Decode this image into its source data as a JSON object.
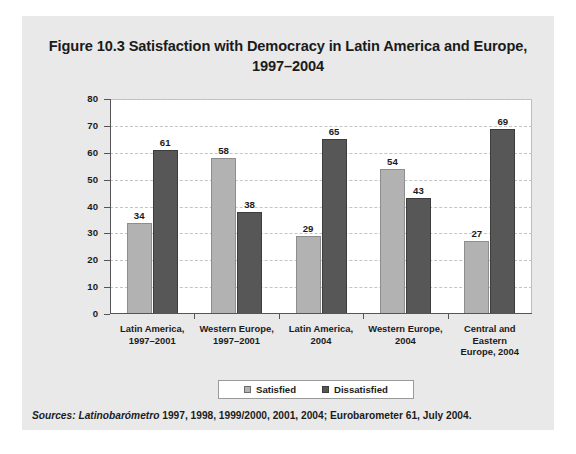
{
  "figure": {
    "title_line1": "Figure 10.3 Satisfaction with Democracy in Latin America and Europe,",
    "title_line2": "1997–2004",
    "source_prefix": "Sources:",
    "source_italic_term": " Latinobarómetro",
    "source_rest": " 1997, 1998, 1999/2000, 2001, 2004; Eurobarometer 61, July 2004."
  },
  "colors": {
    "panel_background": "#e9e9e9",
    "plot_background": "#ffffff",
    "satisfied": "#b2b2b2",
    "dissatisfied": "#575757",
    "gridline": "#c4c4c4",
    "axis": "#555555",
    "text": "#1b1b1b"
  },
  "chart_data": {
    "type": "bar",
    "title": "Figure 10.3 Satisfaction with Democracy in Latin America and Europe, 1997–2004",
    "xlabel": "",
    "ylabel": "",
    "ylim": [
      0,
      80
    ],
    "yticks": [
      0,
      10,
      20,
      30,
      40,
      50,
      60,
      70,
      80
    ],
    "ytick_labels": [
      "0",
      "10",
      "20",
      "30",
      "40",
      "50",
      "60",
      "70",
      "80"
    ],
    "grid": true,
    "legend_position": "bottom",
    "categories": [
      "Latin America, 1997–2001",
      "Western Europe, 1997–2001",
      "Latin America, 2004",
      "Western Europe, 2004",
      "Central and Eastern Europe, 2004"
    ],
    "category_label_lines": [
      [
        "Latin America,",
        "1997–2001"
      ],
      [
        "Western Europe,",
        "1997–2001"
      ],
      [
        "Latin America,",
        "2004"
      ],
      [
        "Western Europe,",
        "2004"
      ],
      [
        "Central and",
        "Eastern",
        "Europe, 2004"
      ]
    ],
    "series": [
      {
        "name": "Satisfied",
        "values": [
          34,
          58,
          29,
          54,
          27
        ]
      },
      {
        "name": "Dissatisfied",
        "values": [
          61,
          38,
          65,
          43,
          69
        ]
      }
    ]
  }
}
